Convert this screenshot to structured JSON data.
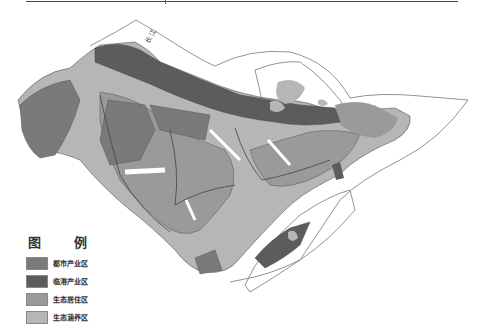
{
  "map": {
    "river_label": "长江",
    "colors": {
      "urban_industry": "#7a7a7a",
      "port_industry": "#5c5c5c",
      "eco_residential": "#9a9a9a",
      "eco_conservation": "#b6b6b6",
      "water": "#ffffff",
      "boundary": "#555555"
    }
  },
  "legend": {
    "title": "图 例",
    "items": [
      {
        "label": "都市产业区",
        "color": "#7a7a7a"
      },
      {
        "label": "临港产业区",
        "color": "#5c5c5c"
      },
      {
        "label": "生态居住区",
        "color": "#9a9a9a"
      },
      {
        "label": "生态涵养区",
        "color": "#b6b6b6"
      }
    ]
  }
}
